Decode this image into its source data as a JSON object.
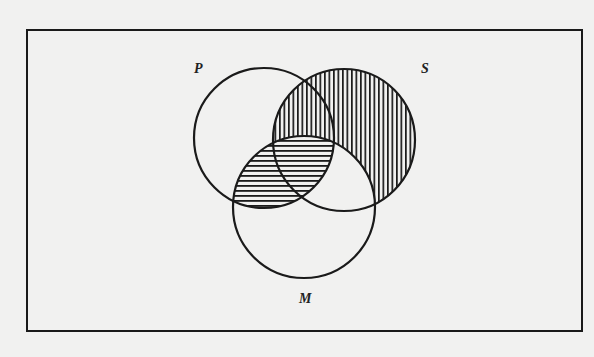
{
  "diagram": {
    "type": "venn",
    "colors": {
      "paper": "#f1f1f0",
      "ink": "#1a1a1a"
    },
    "frame": {
      "x": 27,
      "y": 30,
      "width": 555,
      "height": 301
    },
    "sets": [
      {
        "id": "P",
        "label": "P",
        "cx": 264,
        "cy": 138,
        "r": 70,
        "label_x": 194,
        "label_y": 62
      },
      {
        "id": "S",
        "label": "S",
        "cx": 344,
        "cy": 140,
        "r": 71,
        "label_x": 421,
        "label_y": 62
      },
      {
        "id": "M",
        "label": "M",
        "cx": 304,
        "cy": 207,
        "r": 71,
        "label_x": 299,
        "label_y": 292
      }
    ],
    "shading": [
      {
        "region": "S minus M",
        "pattern": "vertical-lines",
        "spacing": 4.5
      },
      {
        "region": "P intersect M",
        "pattern": "horizontal-lines",
        "spacing": 5
      }
    ]
  }
}
